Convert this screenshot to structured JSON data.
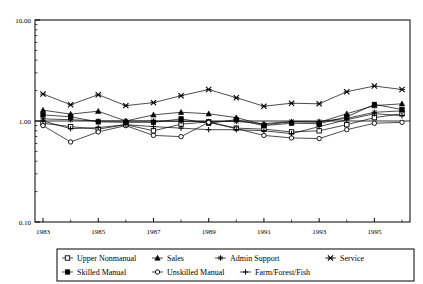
{
  "chart_data": {
    "type": "line",
    "title": "",
    "xlabel": "",
    "ylabel": "",
    "yscale": "log",
    "ylim": [
      0.1,
      10.0
    ],
    "ytick_labels": [
      "10.00",
      "1.00",
      "0.10"
    ],
    "ytick_values": [
      10.0,
      1.0,
      0.1
    ],
    "grid": false,
    "reference_line_y": 1.0,
    "legend_position": "bottom",
    "x": [
      1983,
      1984,
      1985,
      1986,
      1987,
      1988,
      1989,
      1990,
      1991,
      1992,
      1993,
      1994,
      1995,
      1996
    ],
    "xtick_labels": [
      "1983",
      "1985",
      "1987",
      "1989",
      "1991",
      "1993",
      "1995"
    ],
    "xtick_values": [
      1983,
      1985,
      1987,
      1989,
      1991,
      1993,
      1995
    ],
    "series": [
      {
        "name": "Upper Nonmanual",
        "marker": "open-square",
        "values": [
          0.95,
          0.88,
          0.83,
          0.92,
          0.8,
          0.93,
          0.98,
          0.85,
          0.83,
          0.78,
          0.8,
          0.92,
          1.08,
          1.18
        ]
      },
      {
        "name": "Sales",
        "marker": "filled-triangle",
        "values": [
          1.28,
          1.17,
          1.25,
          1.0,
          1.15,
          1.22,
          1.18,
          1.08,
          0.92,
          0.98,
          0.97,
          1.18,
          1.42,
          1.48
        ]
      },
      {
        "name": "Admin Support",
        "marker": "plus-star",
        "values": [
          1.05,
          1.03,
          1.0,
          1.0,
          1.0,
          0.99,
          0.99,
          0.99,
          0.94,
          0.99,
          0.99,
          1.06,
          1.22,
          1.26
        ]
      },
      {
        "name": "Service",
        "marker": "cross-x",
        "values": [
          1.85,
          1.45,
          1.82,
          1.42,
          1.52,
          1.78,
          2.05,
          1.7,
          1.4,
          1.5,
          1.48,
          1.95,
          2.22,
          2.05
        ]
      },
      {
        "name": "Skilled Manual",
        "marker": "filled-square",
        "values": [
          1.15,
          1.1,
          0.98,
          0.97,
          0.97,
          1.05,
          0.95,
          1.03,
          0.9,
          0.95,
          0.94,
          1.1,
          1.46,
          1.3
        ]
      },
      {
        "name": "Unskilled Manual",
        "marker": "open-circle",
        "values": [
          0.9,
          0.62,
          0.78,
          0.9,
          0.72,
          0.7,
          0.97,
          0.84,
          0.72,
          0.68,
          0.67,
          0.82,
          0.95,
          0.97
        ]
      },
      {
        "name": "Farm/Forest/Fish",
        "marker": "plus-thin",
        "values": [
          1.0,
          0.84,
          0.86,
          0.92,
          0.88,
          0.85,
          0.82,
          0.82,
          0.8,
          0.75,
          0.88,
          1.03,
          1.18,
          1.13
        ]
      }
    ]
  },
  "legend": {
    "row1": [
      {
        "label": "Upper Nonmanual",
        "marker": "open-square"
      },
      {
        "label": "Sales",
        "marker": "filled-triangle"
      },
      {
        "label": "Admin Support",
        "marker": "plus-star"
      },
      {
        "label": "Service",
        "marker": "cross-x"
      }
    ],
    "row2": [
      {
        "label": "Skilled Manual",
        "marker": "filled-square"
      },
      {
        "label": "Unskilled Manual",
        "marker": "open-circle"
      },
      {
        "label": "Farm/Forest/Fish",
        "marker": "plus-thin"
      }
    ]
  },
  "colors": {
    "line": "#000000",
    "axis": "#000000",
    "background": "#ffffff"
  }
}
